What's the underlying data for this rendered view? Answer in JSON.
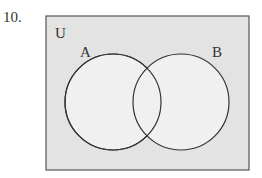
{
  "question": {
    "number": "10."
  },
  "diagram": {
    "universe_label": "U",
    "sets": [
      {
        "label": "A"
      },
      {
        "label": "B"
      }
    ],
    "colors": {
      "universe_fill": "#e3e3e3",
      "circle_fill": "#f0f0f0",
      "stroke": "#333333"
    }
  }
}
